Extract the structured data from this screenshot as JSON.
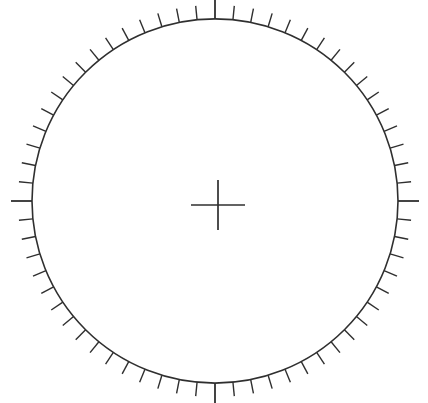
{
  "canvas": {
    "width": 428,
    "height": 403,
    "background_color": "#ffffff"
  },
  "dial": {
    "name": "graduated-dial-face",
    "center_x": 215,
    "center_y": 201,
    "radius": 183,
    "stroke_color": "#2f2f2f",
    "stroke_width": 1.6,
    "squash_y": 0.995
  },
  "ticks": {
    "count": 64,
    "start_angle_deg": -90,
    "minor_length": 14,
    "major_length": 21,
    "major_indices": [
      0,
      16,
      32,
      48
    ],
    "minor_stroke_width": 1.4,
    "major_stroke_width": 1.8,
    "stroke_color": "#2f2f2f",
    "direction": "outward"
  },
  "center_mark": {
    "name": "center-crosshair",
    "center_x": 218,
    "center_y": 205,
    "half_width": 27,
    "half_height": 25,
    "stroke_color": "#2f2f2f",
    "stroke_width": 1.7
  },
  "labels": {
    "figure_title": "",
    "units": "",
    "notes": ""
  }
}
